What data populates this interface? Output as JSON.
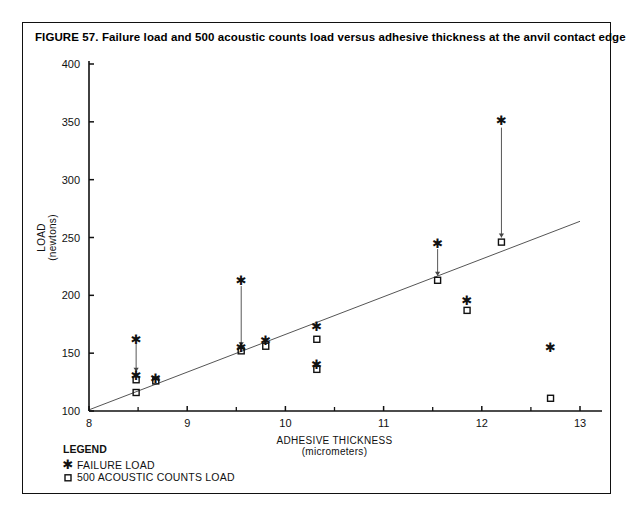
{
  "figure": {
    "title": "FIGURE 57. Failure load and 500 acoustic counts load versus adhesive thickness at the anvil contact edge"
  },
  "legend": {
    "heading": "LEGEND",
    "items": [
      {
        "marker": "star-marker-icon",
        "label": "FAILURE LOAD"
      },
      {
        "marker": "circle-marker-icon",
        "label": "500 ACOUSTIC COUNTS LOAD"
      }
    ]
  },
  "chart_data": {
    "type": "scatter",
    "title": "Failure load and 500 acoustic counts load versus adhesive thickness at the anvil contact edge",
    "xlabel": "ADHESIVE THICKNESS",
    "xlabel_units": "(micrometers)",
    "ylabel": "LOAD",
    "ylabel_units": "(newtons)",
    "xlim": [
      8,
      13
    ],
    "ylim": [
      100,
      400
    ],
    "xticks": [
      8,
      9,
      10,
      11,
      12,
      13
    ],
    "xticklabels": [
      "8",
      "9",
      "10",
      "11",
      "12",
      "13"
    ],
    "xminorticks": [
      8.5,
      9.5,
      10.5,
      11.5,
      12.5
    ],
    "yticks": [
      100,
      150,
      200,
      250,
      300,
      350,
      400
    ],
    "yticklabels": [
      "100",
      "150",
      "200",
      "250",
      "300",
      "350",
      "400"
    ],
    "grid": false,
    "legend_position": "below-axes-left",
    "series": [
      {
        "name": "FAILURE LOAD",
        "marker": "star",
        "points": [
          {
            "x": 8.48,
            "y": 162
          },
          {
            "x": 8.48,
            "y": 131
          },
          {
            "x": 8.68,
            "y": 128
          },
          {
            "x": 9.55,
            "y": 213
          },
          {
            "x": 9.55,
            "y": 155
          },
          {
            "x": 9.8,
            "y": 161
          },
          {
            "x": 10.32,
            "y": 173
          },
          {
            "x": 10.32,
            "y": 140
          },
          {
            "x": 11.55,
            "y": 245
          },
          {
            "x": 11.85,
            "y": 196
          },
          {
            "x": 12.2,
            "y": 351
          },
          {
            "x": 12.7,
            "y": 155
          }
        ]
      },
      {
        "name": "500 ACOUSTIC COUNTS LOAD",
        "marker": "circle",
        "points": [
          {
            "x": 8.48,
            "y": 127
          },
          {
            "x": 8.48,
            "y": 116
          },
          {
            "x": 8.68,
            "y": 126
          },
          {
            "x": 9.55,
            "y": 152
          },
          {
            "x": 9.8,
            "y": 156
          },
          {
            "x": 10.32,
            "y": 162
          },
          {
            "x": 10.32,
            "y": 136
          },
          {
            "x": 11.55,
            "y": 213
          },
          {
            "x": 11.85,
            "y": 187
          },
          {
            "x": 12.2,
            "y": 246
          },
          {
            "x": 12.7,
            "y": 111
          }
        ]
      }
    ],
    "arrows": [
      {
        "x": 8.48,
        "y_from": 158,
        "y_to": 134
      },
      {
        "x": 9.55,
        "y_from": 208,
        "y_to": 156
      },
      {
        "x": 11.55,
        "y_from": 240,
        "y_to": 217
      },
      {
        "x": 12.2,
        "y_from": 345,
        "y_to": 250
      }
    ],
    "trendline": {
      "x_from": 8.0,
      "y_from": 101,
      "x_to": 13.0,
      "y_to": 264
    }
  }
}
